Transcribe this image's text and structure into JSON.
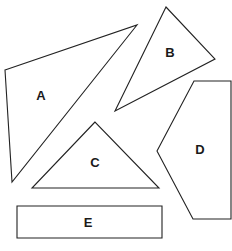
{
  "diagram": {
    "type": "shapes",
    "top_fragment": "g",
    "shapes": [
      {
        "id": "A",
        "label": "A",
        "kind": "triangle",
        "points": "5,70 137,25 12,182",
        "label_pos": [
          41,
          95
        ]
      },
      {
        "id": "B",
        "label": "B",
        "kind": "triangle",
        "points": "166,7 215,59 115,111",
        "label_pos": [
          170,
          52
        ]
      },
      {
        "id": "C",
        "label": "C",
        "kind": "triangle",
        "points": "95,122 32,188 159,188",
        "label_pos": [
          95,
          162
        ]
      },
      {
        "id": "D",
        "label": "D",
        "kind": "pentagon",
        "points": "194,81 231,81 231,219 193,219 157,151",
        "label_pos": [
          200,
          149
        ]
      },
      {
        "id": "E",
        "label": "E",
        "kind": "rectangle",
        "points": "17,206 162,206 162,238 17,238",
        "label_pos": [
          88,
          222
        ]
      }
    ]
  }
}
